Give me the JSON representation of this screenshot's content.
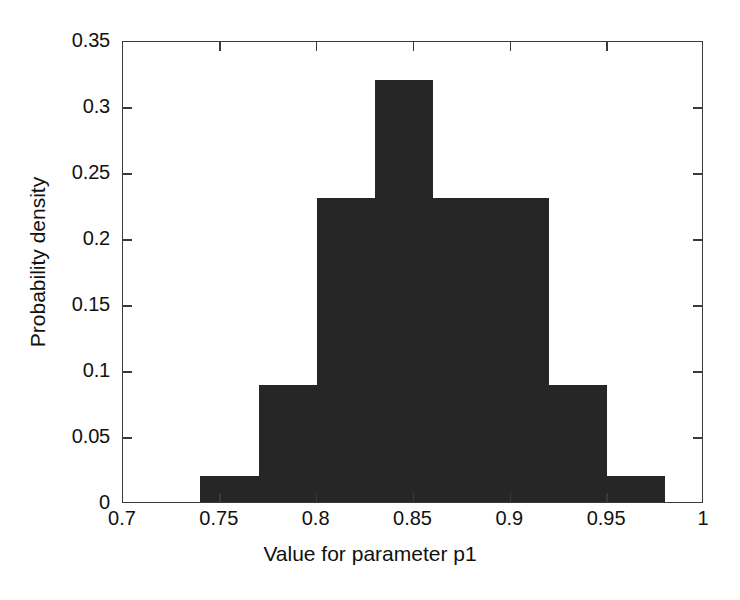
{
  "chart_data": {
    "type": "bar",
    "title": "",
    "subtitle": "",
    "xlabel": "Value for parameter p1",
    "ylabel": "Probability density",
    "xlim": [
      0.7,
      1.0
    ],
    "ylim": [
      0,
      0.35
    ],
    "grid": false,
    "legend": null,
    "bin_width": 0.03,
    "bar_color": "#262626",
    "axis_color": "#3a3a3a",
    "background": "#ffffff",
    "xticks": [
      "0.7",
      "0.75",
      "0.8",
      "0.85",
      "0.9",
      "0.95",
      "1"
    ],
    "xtick_values": [
      0.7,
      0.75,
      0.8,
      0.85,
      0.9,
      0.95,
      1.0
    ],
    "yticks": [
      "0",
      "0.05",
      "0.1",
      "0.15",
      "0.2",
      "0.25",
      "0.3",
      "0.35"
    ],
    "ytick_values": [
      0,
      0.05,
      0.1,
      0.15,
      0.2,
      0.25,
      0.3,
      0.35
    ],
    "bins": [
      {
        "left": 0.74,
        "right": 0.77,
        "value": 0.02
      },
      {
        "left": 0.77,
        "right": 0.8,
        "value": 0.089
      },
      {
        "left": 0.8,
        "right": 0.83,
        "value": 0.23
      },
      {
        "left": 0.83,
        "right": 0.86,
        "value": 0.32
      },
      {
        "left": 0.86,
        "right": 0.89,
        "value": 0.23
      },
      {
        "left": 0.89,
        "right": 0.92,
        "value": 0.23
      },
      {
        "left": 0.92,
        "right": 0.95,
        "value": 0.089
      },
      {
        "left": 0.95,
        "right": 0.98,
        "value": 0.02
      }
    ],
    "categories": [
      "0.74-0.77",
      "0.77-0.80",
      "0.80-0.83",
      "0.83-0.86",
      "0.86-0.89",
      "0.89-0.92",
      "0.92-0.95",
      "0.95-0.98"
    ],
    "values": [
      0.02,
      0.089,
      0.23,
      0.32,
      0.23,
      0.23,
      0.089,
      0.02
    ]
  }
}
